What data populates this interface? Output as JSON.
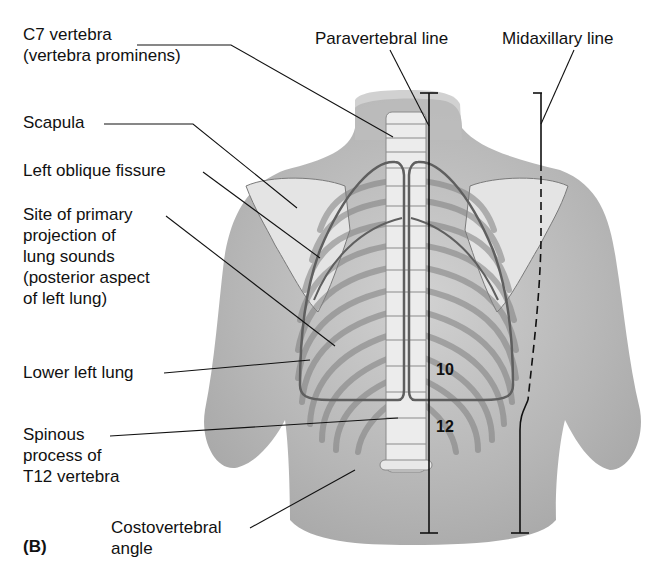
{
  "figure": {
    "panel_label": "(B)",
    "view": "posterior thorax",
    "labels": {
      "c7": [
        "C7 vertebra",
        "(vertebra prominens)"
      ],
      "scapula": [
        "Scapula"
      ],
      "oblique_fissure": [
        "Left oblique fissure"
      ],
      "lung_sounds": [
        "Site of primary",
        "projection of",
        "lung sounds",
        "(posterior aspect",
        "of left lung)"
      ],
      "lower_left_lung": [
        "Lower left lung"
      ],
      "spinous": [
        "Spinous",
        "process of",
        "T12 vertebra"
      ],
      "costovertebral": [
        "Costovertebral",
        "angle"
      ],
      "paravertebral": [
        "Paravertebral line"
      ],
      "midaxillary": [
        "Midaxillary line"
      ]
    },
    "rib_numbers": [
      "10",
      "12"
    ]
  }
}
